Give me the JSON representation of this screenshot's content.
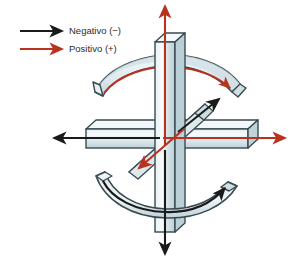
{
  "figure": {
    "title": "",
    "background_color": "#ffffff"
  },
  "legend": {
    "items": [
      {
        "label": "Negativo (−)",
        "color": "#1a1a1a",
        "arrow_icon": "straight-arrow-right-icon",
        "sign": "−",
        "meaning": "Negativo"
      },
      {
        "label": "Positivo (+)",
        "color": "#b8321f",
        "arrow_icon": "straight-arrow-right-icon",
        "sign": "+",
        "meaning": "Positivo"
      }
    ]
  },
  "colors": {
    "negative": "#1a1a1a",
    "positive": "#b8321f",
    "bar_face_light": "#eef4f6",
    "bar_face_mid": "#cfdfe4",
    "bar_face_dark": "#a9c2ca",
    "bar_outline": "#3a4a50",
    "arc_face": "#dfeaee",
    "arc_shadow": "#b4c9d1"
  },
  "axes": [
    {
      "name": "vertical-axis",
      "orientation": "vertical",
      "positive_direction": "up",
      "positive_arrow_color": "#b8321f",
      "negative_direction": "down",
      "negative_arrow_color": "#1a1a1a"
    },
    {
      "name": "horizontal-axis",
      "orientation": "horizontal",
      "positive_direction": "right",
      "positive_arrow_color": "#b8321f",
      "negative_direction": "left",
      "negative_arrow_color": "#1a1a1a"
    },
    {
      "name": "diagonal-axis",
      "orientation": "diagonal",
      "positive_direction": "down-left",
      "positive_arrow_color": "#b8321f",
      "negative_direction": "up-right",
      "negative_arrow_color": "#1a1a1a"
    }
  ],
  "rotation_arcs": [
    {
      "name": "upper-rotation-arc",
      "position": "top",
      "curvature": "convex-up",
      "arrow_color": "#b8321f",
      "arrow_direction": "right",
      "sign": "+"
    },
    {
      "name": "lower-rotation-arc",
      "position": "bottom",
      "curvature": "concave-up",
      "arrow_color": "#1a1a1a",
      "arrow_direction": "right",
      "sign": "−"
    }
  ]
}
